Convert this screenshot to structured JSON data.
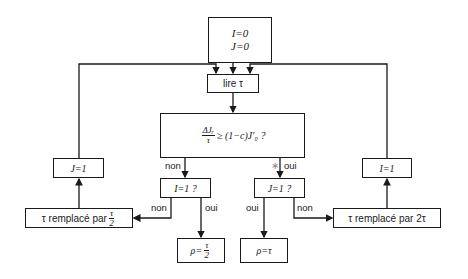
{
  "nodes": {
    "init": {
      "line1": "I=0",
      "line2": "J=0"
    },
    "read": {
      "label": "lire τ"
    },
    "condition": {
      "num": "ΔJᵣ",
      "den": "τ",
      "rhs": "≥ (1−c)J′₀   ?"
    },
    "i_check": {
      "label": "I=1 ?"
    },
    "j_check": {
      "label": "J=1 ?"
    },
    "set_j": {
      "label": "J=1"
    },
    "set_i": {
      "label": "I=1"
    },
    "halve": {
      "prefix": "τ remplacé par",
      "num": "τ",
      "den": "2"
    },
    "double": {
      "label": "τ remplacé par 2τ"
    },
    "rho_half": {
      "prefix": "ρ=",
      "num": "τ",
      "den": "2"
    },
    "rho": {
      "label": "ρ=τ"
    }
  },
  "edge_labels": {
    "cond_non": "non",
    "cond_oui": "oui",
    "cond_star": "∗",
    "i_non": "non",
    "i_oui": "oui",
    "j_oui": "oui",
    "j_non": "non"
  }
}
